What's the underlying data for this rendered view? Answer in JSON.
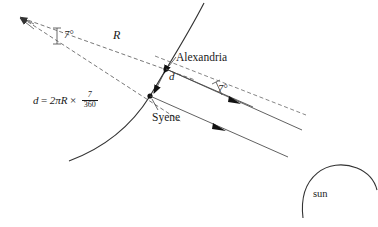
{
  "diagram": {
    "stroke_color": "#333333",
    "text_color": "#1a1a1a",
    "background_color": "#ffffff",
    "labels": {
      "alexandria": "Alexandria",
      "syene": "Syene",
      "sun": "sun",
      "radius": "R",
      "arc_distance": "d",
      "angle_at_center": "7°",
      "angle_at_alexandria": "7°"
    },
    "formula": {
      "lhs": "d",
      "equals": "=",
      "coefficient": "2πR",
      "times": "×",
      "numerator": "7",
      "denominator": "360",
      "full_text": "d = 2πR × 7/360"
    },
    "elements": {
      "earth_arc": "earth-arc",
      "sun_arc": "sun-arc",
      "radius_line_alexandria": "radius-to-alexandria",
      "radius_line_syene": "radius-to-syene",
      "sun_ray_upper": "sun-ray-upper",
      "sun_ray_lower": "sun-ray-lower",
      "gnomon_shadow_line": "shadow-line",
      "angle_arc_center": "angle-arc-center",
      "angle_arc_alexandria": "angle-arc-alexandria"
    },
    "points": {
      "earth_center": [
        22,
        18
      ],
      "alexandria": [
        166,
        69
      ],
      "syene": [
        150,
        96
      ]
    }
  }
}
